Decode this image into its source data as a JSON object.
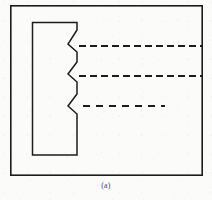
{
  "figure": {
    "caption": "(a)",
    "background_color": "#fbfbfa",
    "ink_color": "#1c1c1c",
    "border": {
      "name": "outer-frame",
      "x": 10,
      "y": 5,
      "width": 193,
      "height": 171,
      "stroke_width": 1.6
    },
    "notched_block": {
      "name": "notched-rectangle",
      "description": "tall rectangle with three V-notches cut into its right edge",
      "left": 32,
      "top": 22,
      "right": 77,
      "bottom": 155,
      "stroke_width": 1.5,
      "notch_count": 3,
      "notch_apex_x": 68,
      "notches": [
        {
          "label": "notch-1",
          "top_y": 30,
          "apex_y": 44,
          "bottom_y": 52
        },
        {
          "label": "notch-2",
          "top_y": 62,
          "apex_y": 74,
          "bottom_y": 82
        },
        {
          "label": "notch-3",
          "top_y": 94,
          "apex_y": 106,
          "bottom_y": 114
        }
      ]
    },
    "dashed_lines": [
      {
        "label": "dashed-line-1",
        "y": 46,
        "x_start": 79,
        "x_end": 203,
        "length_class": "full",
        "dash": 7,
        "gap": 4,
        "stroke_width": 2.0
      },
      {
        "label": "dashed-line-2",
        "y": 76,
        "x_start": 79,
        "x_end": 203,
        "length_class": "full",
        "dash": 7,
        "gap": 4,
        "stroke_width": 2.0
      },
      {
        "label": "dashed-line-3",
        "y": 106,
        "x_start": 83,
        "x_end": 165,
        "length_class": "short",
        "dash": 7,
        "gap": 6,
        "stroke_width": 2.0
      }
    ]
  }
}
